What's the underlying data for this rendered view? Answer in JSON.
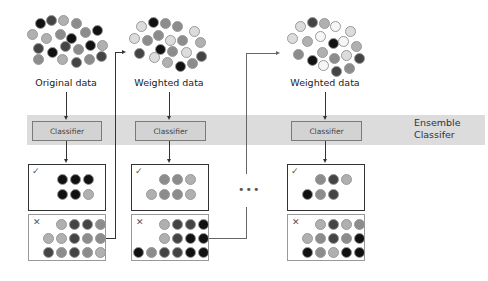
{
  "diagram": {
    "band_label_line1": "Ensemble",
    "band_label_line2": "Classifer",
    "ellipsis": "•••",
    "stages": [
      {
        "data_label": "Original data",
        "classifier_label": "Classifier",
        "correct_mark": "✓",
        "wrong_mark": "✕"
      },
      {
        "data_label": "Weighted data",
        "classifier_label": "Classifier",
        "correct_mark": "✓",
        "wrong_mark": "✕"
      },
      {
        "data_label": "Weighted data",
        "classifier_label": "Classifier",
        "correct_mark": "✓",
        "wrong_mark": "✕"
      }
    ],
    "colors": {
      "black": "#111111",
      "dark": "#444444",
      "mid": "#6e6e6e",
      "gray": "#8c8c8c",
      "light": "#b0b0b0",
      "pale": "#dcdcdc",
      "white": "#f6f6f6",
      "band": "#dcdcdc",
      "classifier_fill": "#d3d3d3"
    }
  }
}
